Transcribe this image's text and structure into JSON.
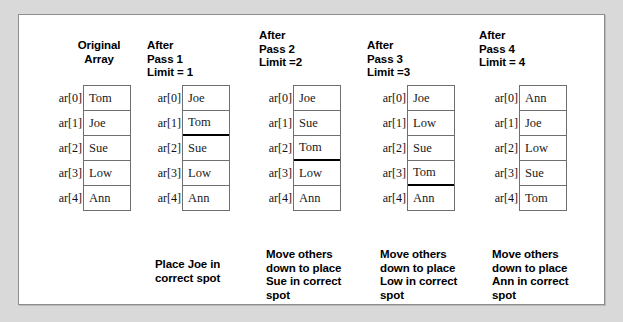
{
  "figure": {
    "index_labels": [
      "ar[0]",
      "ar[1]",
      "ar[2]",
      "ar[3]",
      "ar[4]"
    ],
    "colors": {
      "page_background": "#d9d9d9",
      "panel_background": "#ffffff",
      "panel_border": "#8d8d8d",
      "cell_border": "#6f6f6f",
      "divider": "#000000",
      "text": "#000000"
    },
    "columns": [
      {
        "header": "Original\nArray",
        "header_align": "center",
        "header_top": 24,
        "left": 20,
        "box_left": 44,
        "values": [
          "Tom",
          "Joe",
          "Sue",
          "Low",
          "Ann"
        ],
        "divider_after_index": null,
        "caption": "",
        "caption_top": null
      },
      {
        "header": "After\nPass 1\nLimit = 1",
        "header_align": "left",
        "header_top": 24,
        "left": 128,
        "box_left": 35,
        "values": [
          "Joe",
          "Tom",
          "Sue",
          "Low",
          "Ann"
        ],
        "divider_after_index": 1,
        "caption": "Place Joe in\ncorrect spot",
        "caption_top": 243
      },
      {
        "header": "After\nPass 2\nLimit =2",
        "header_align": "left",
        "header_top": 14,
        "left": 240,
        "box_left": 34,
        "values": [
          "Joe",
          "Sue",
          "Tom",
          "Low",
          "Ann"
        ],
        "divider_after_index": 2,
        "caption": "Move others\ndown to place\nSue in correct\nspot",
        "caption_top": 233
      },
      {
        "header": "After\nPass 3\nLimit =3",
        "header_align": "left",
        "header_top": 24,
        "left": 348,
        "box_left": 40,
        "values": [
          "Joe",
          "Low",
          "Sue",
          "Tom",
          "Ann"
        ],
        "divider_after_index": 3,
        "caption": "Move others\ndown to place\nLow in correct\nspot",
        "caption_top": 233
      },
      {
        "header": "After\nPass 4\nLimit = 4",
        "header_align": "left",
        "header_top": 14,
        "left": 460,
        "box_left": 40,
        "values": [
          "Ann",
          "Joe",
          "Low",
          "Sue",
          "Tom"
        ],
        "divider_after_index": null,
        "caption": "Move others\ndown to place\nAnn in correct\nspot",
        "caption_top": 233
      }
    ]
  }
}
